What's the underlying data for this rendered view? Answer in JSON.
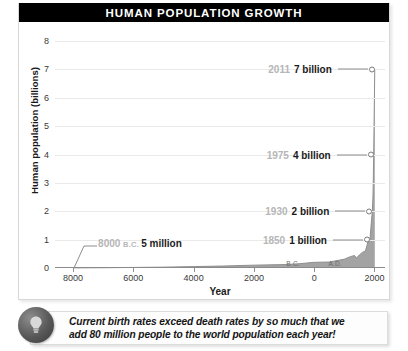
{
  "header": {
    "title": "HUMAN POPULATION GROWTH"
  },
  "caption": {
    "icon": "lightbulb-icon",
    "line1": "Current birth rates exceed death rates by so much that we",
    "line2": "add 80 million people to the world population each year!"
  },
  "colors": {
    "title_bar_bg": "#000000",
    "title_bar_text": "#ffffff",
    "curve_fill": "#a3a3a3",
    "curve_line": "#8f8f8f",
    "gridline": "#e9e9e9",
    "axis": "#8a8a8a",
    "callout_year": "#b6b6b6",
    "callout_value": "#1a1a1a",
    "card_bg": "#ffffff"
  },
  "chart_data": {
    "type": "area",
    "title": "HUMAN POPULATION GROWTH",
    "xlabel": "Year",
    "ylabel": "Human population (billions)",
    "ylim": [
      0,
      8
    ],
    "y_ticks": [
      "0",
      "1",
      "2",
      "3",
      "4",
      "5",
      "6",
      "7",
      "8"
    ],
    "x_ticks": [
      "8000",
      "6000",
      "4000",
      "2000",
      "0",
      "2000"
    ],
    "x_tick_years": [
      -8000,
      -6000,
      -4000,
      -2000,
      0,
      2000
    ],
    "era_labels": [
      {
        "text": "B.C.",
        "year": -700
      },
      {
        "text": "A.D.",
        "year": 700
      }
    ],
    "xlim": [
      -8600,
      2350
    ],
    "grid": true,
    "legend": "none",
    "x": [
      -8000,
      -7000,
      -6000,
      -5000,
      -4000,
      -3000,
      -2000,
      -1000,
      -500,
      0,
      500,
      1000,
      1200,
      1340,
      1400,
      1500,
      1600,
      1700,
      1750,
      1800,
      1850,
      1900,
      1930,
      1950,
      1960,
      1975,
      1990,
      2000,
      2011
    ],
    "values": [
      0.005,
      0.01,
      0.02,
      0.03,
      0.05,
      0.07,
      0.1,
      0.12,
      0.15,
      0.2,
      0.21,
      0.31,
      0.4,
      0.44,
      0.35,
      0.46,
      0.55,
      0.6,
      0.79,
      0.98,
      1.0,
      1.65,
      2.0,
      2.5,
      3.0,
      4.0,
      5.3,
      6.1,
      7.0
    ],
    "annotations": [
      {
        "year_label": "8000",
        "era": "B.C.",
        "value_label": "5 million",
        "x_year": -8000,
        "y_value": 0.005,
        "side": "right-of-point"
      },
      {
        "year_label": "1850",
        "era": "",
        "value_label": "1 billion",
        "x_year": 1850,
        "y_value": 1,
        "side": "left-of-point"
      },
      {
        "year_label": "1930",
        "era": "",
        "value_label": "2 billion",
        "x_year": 1930,
        "y_value": 2,
        "side": "left-of-point"
      },
      {
        "year_label": "1975",
        "era": "",
        "value_label": "4 billion",
        "x_year": 1975,
        "y_value": 4,
        "side": "left-of-point"
      },
      {
        "year_label": "2011",
        "era": "",
        "value_label": "7 billion",
        "x_year": 2011,
        "y_value": 7,
        "side": "left-of-point"
      }
    ]
  }
}
